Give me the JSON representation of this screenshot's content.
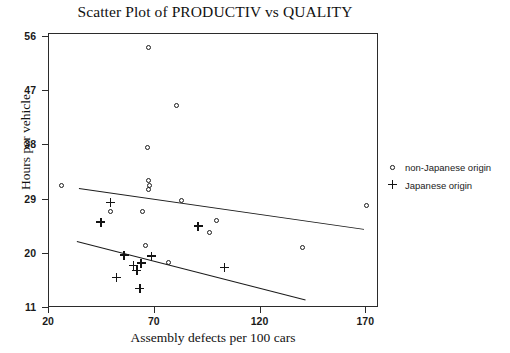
{
  "chart_data": {
    "type": "scatter",
    "title": "Scatter Plot of PRODUCTIV vs QUALITY",
    "xlabel": "Assembly defects per 100 cars",
    "ylabel": "Hours per vehicle",
    "xlim": [
      20,
      176
    ],
    "ylim": [
      11,
      56.5
    ],
    "xticks": [
      20,
      70,
      120,
      170
    ],
    "yticks": [
      11,
      20,
      29,
      38,
      47,
      56
    ],
    "grid": false,
    "legend_position": "right-outside",
    "series": [
      {
        "name": "non-Japanese origin",
        "marker": "circle",
        "color": "#1b1b1b",
        "points": [
          [
            67.0,
            54.2
          ],
          [
            80.5,
            44.7
          ],
          [
            66.5,
            37.6
          ],
          [
            26.0,
            31.4
          ],
          [
            67.0,
            32.1
          ],
          [
            67.5,
            31.4
          ],
          [
            67.0,
            30.6
          ],
          [
            82.5,
            28.8
          ],
          [
            49.0,
            27.1
          ],
          [
            64.0,
            27.0
          ],
          [
            99.0,
            25.5
          ],
          [
            96.0,
            23.6
          ],
          [
            65.5,
            21.4
          ],
          [
            76.5,
            18.6
          ],
          [
            140.0,
            21.0
          ],
          [
            170.0,
            28.1
          ]
        ]
      },
      {
        "name": "Japanese origin",
        "marker": "plus",
        "color": "#141414",
        "points": [
          [
            49.0,
            28.5
          ],
          [
            44.5,
            25.2
          ],
          [
            90.5,
            24.6
          ],
          [
            55.5,
            19.8
          ],
          [
            68.5,
            19.6
          ],
          [
            60.0,
            18.0
          ],
          [
            63.5,
            18.4
          ],
          [
            61.5,
            17.2
          ],
          [
            52.0,
            16.0
          ],
          [
            63.0,
            14.2
          ],
          [
            103.0,
            17.7
          ]
        ]
      }
    ],
    "fit_lines": [
      {
        "name": "non-Japanese fit",
        "x0": 34.0,
        "y0": 31.0,
        "x1": 169.0,
        "y1": 24.2
      },
      {
        "name": "Japanese fit",
        "x0": 33.0,
        "y0": 22.2,
        "x1": 141.0,
        "y1": 12.5
      }
    ]
  },
  "axes": {
    "x_tick_labels": [
      "20",
      "70",
      "120",
      "170"
    ],
    "y_tick_labels": [
      "56",
      "47",
      "38",
      "29",
      "20",
      "11"
    ]
  },
  "legend": {
    "items": [
      {
        "label": "non-Japanese origin",
        "marker": "circle-marker-icon"
      },
      {
        "label": "Japanese origin",
        "marker": "plus-marker-icon"
      }
    ]
  }
}
